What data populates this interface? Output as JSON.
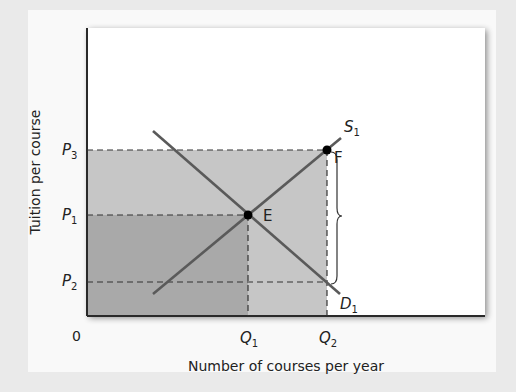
{
  "diagram": {
    "type": "supply-demand",
    "y_axis_label": "Tuition per course",
    "x_axis_label": "Number of courses per year",
    "origin_label": "0",
    "price_labels": [
      {
        "base": "P",
        "sub": "3"
      },
      {
        "base": "P",
        "sub": "1"
      },
      {
        "base": "P",
        "sub": "2"
      }
    ],
    "quantity_labels": [
      {
        "base": "Q",
        "sub": "1"
      },
      {
        "base": "Q",
        "sub": "2"
      }
    ],
    "curves": [
      {
        "name": "supply",
        "base": "S",
        "sub": "1"
      },
      {
        "name": "demand",
        "base": "D",
        "sub": "1"
      }
    ],
    "points": [
      {
        "name": "equilibrium",
        "label": "E"
      },
      {
        "name": "subsidy-point",
        "label": "F"
      }
    ],
    "colors": {
      "light_shade": "#c6c6c6",
      "dark_shade": "#a9a9a9",
      "curve": "#5a5a5a",
      "frame": "#2a2a2a",
      "plot_bg": "#ffffff"
    }
  }
}
